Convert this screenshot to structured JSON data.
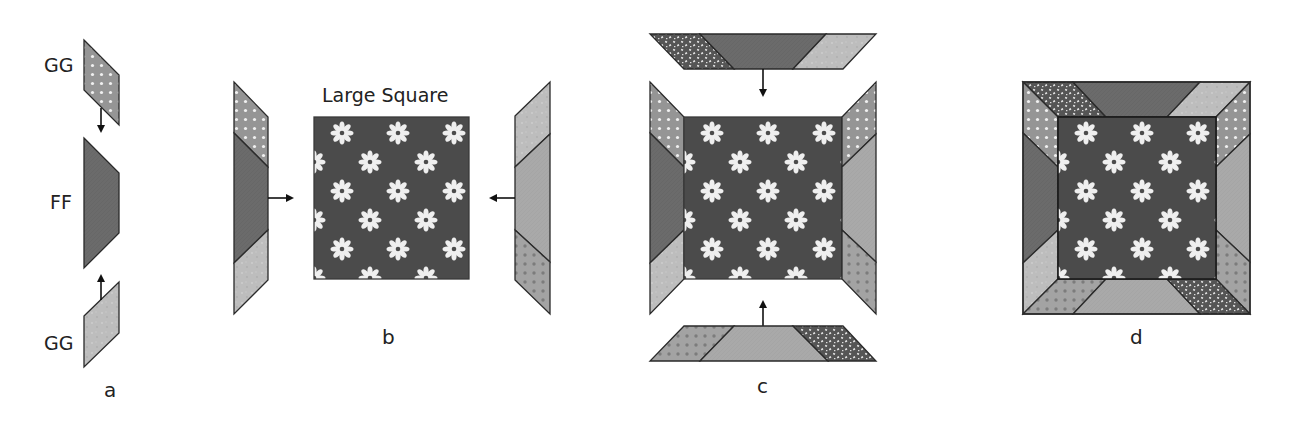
{
  "labels": {
    "gg_top": "GG",
    "ff": "FF",
    "gg_bottom": "GG",
    "large_square": "Large Square"
  },
  "steps": {
    "a": "a",
    "b": "b",
    "c": "c",
    "d": "d"
  },
  "fabrics": {
    "flower_background": "#4b4b4b",
    "flower_petal": "#efefef",
    "ff_dark": "#6b6b6b",
    "light_speckle": "#bdbdbd",
    "light_gray": "#a9a9a9",
    "gray_white_dots": "#959595",
    "gray_dark_dots": "#a3a3a3",
    "dark_speckle": "#555555",
    "outline": "#2a2a2a"
  }
}
